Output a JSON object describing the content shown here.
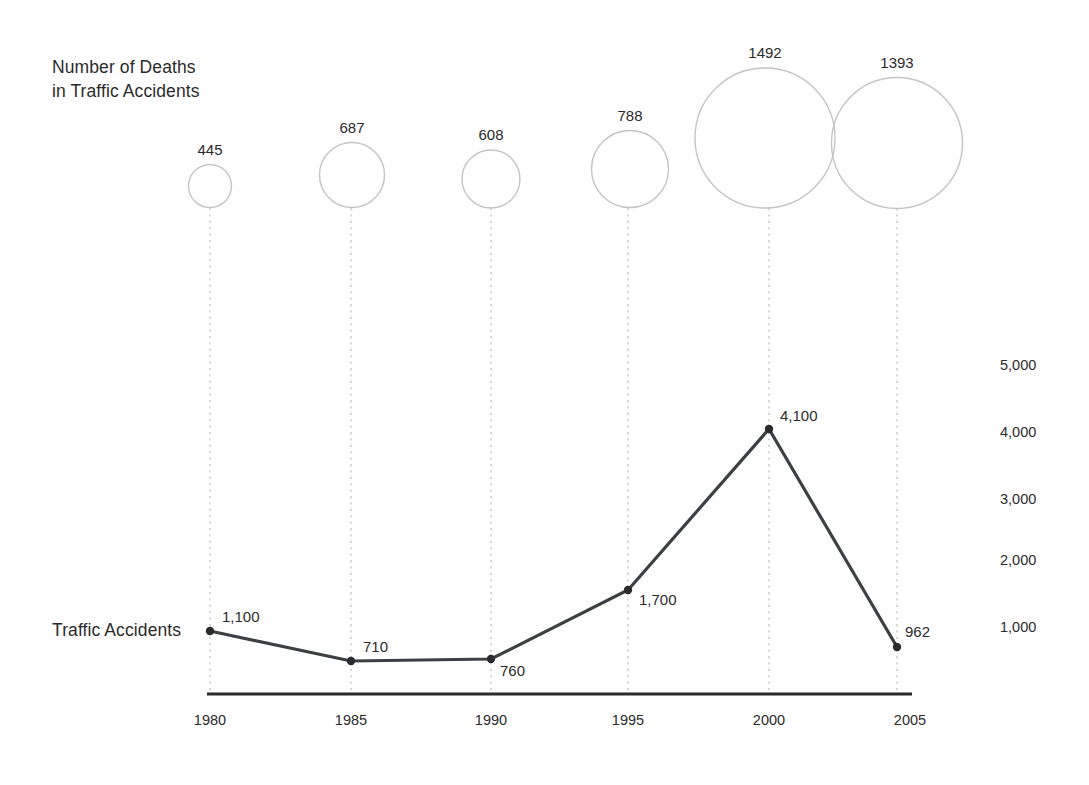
{
  "chart_data": {
    "type": "line",
    "title": "",
    "x": [
      1980,
      1985,
      1990,
      1995,
      2000,
      2005
    ],
    "xlabel": "",
    "ylabel": "",
    "grid": "vertical-dotted",
    "legend": "inline-series-labels",
    "series": [
      {
        "name": "Number of Deaths\nin Traffic Accidents",
        "render": "bubble",
        "values": [
          445,
          687,
          608,
          788,
          1492,
          1393
        ],
        "value_labels": [
          "445",
          "687",
          "608",
          "788",
          "1492",
          "1393"
        ]
      },
      {
        "name": "Traffic Accidents",
        "render": "line",
        "values": [
          1100,
          710,
          760,
          1700,
          4100,
          962
        ],
        "value_labels": [
          "1,100",
          "710",
          "760",
          "1,700",
          "4,100",
          "962"
        ],
        "ylim": [
          0,
          5000
        ],
        "yticks": [
          1000,
          2000,
          3000,
          4000,
          5000
        ],
        "ytick_labels": [
          "1,000",
          "2,000",
          "3,000",
          "4,000",
          "5,000"
        ]
      }
    ],
    "xtick_labels": [
      "1980",
      "1985",
      "1990",
      "1995",
      "2000",
      "2005"
    ]
  },
  "bubble_series": {
    "title": "Number of Deaths\nin Traffic Accidents",
    "points": [
      {
        "label": "445",
        "cx": 210,
        "cy": 186,
        "r": 21.5
      },
      {
        "label": "687",
        "cx": 352,
        "cy": 175,
        "r": 32.5
      },
      {
        "label": "608",
        "cx": 491,
        "cy": 179,
        "r": 29.0
      },
      {
        "label": "788",
        "cx": 630,
        "cy": 169,
        "r": 38.5
      },
      {
        "label": "1492",
        "cx": 765,
        "cy": 138,
        "r": 70.0
      },
      {
        "label": "1393",
        "cx": 897,
        "cy": 143,
        "r": 65.5
      }
    ]
  },
  "line_series": {
    "title": "Traffic Accidents",
    "points": [
      {
        "label": "1,100",
        "x": 210,
        "y": 631,
        "label_x": 222,
        "label_y": 608
      },
      {
        "label": "710",
        "x": 351,
        "y": 661,
        "label_x": 363,
        "label_y": 638
      },
      {
        "label": "760",
        "x": 491,
        "y": 659,
        "label_x": 500,
        "label_y": 662
      },
      {
        "label": "1,700",
        "x": 628,
        "y": 590,
        "label_x": 639,
        "label_y": 591
      },
      {
        "label": "4,100",
        "x": 769,
        "y": 429,
        "label_x": 780,
        "label_y": 407
      },
      {
        "label": "962",
        "x": 897,
        "y": 647,
        "label_x": 905,
        "label_y": 623
      }
    ]
  },
  "x_axis": {
    "ticks": [
      {
        "label": "1980",
        "x": 210
      },
      {
        "label": "1985",
        "x": 351
      },
      {
        "label": "1990",
        "x": 491
      },
      {
        "label": "1995",
        "x": 628
      },
      {
        "label": "2000",
        "x": 769
      },
      {
        "label": "2005",
        "x": 910
      }
    ],
    "line_y": 694,
    "line_x1": 207,
    "line_x2": 912,
    "label_y": 712
  },
  "y_axis": {
    "ticks": [
      {
        "label": "5,000",
        "y": 357
      },
      {
        "label": "4,000",
        "y": 424
      },
      {
        "label": "3,000",
        "y": 491
      },
      {
        "label": "2,000",
        "y": 552
      },
      {
        "label": "1,000",
        "y": 619
      }
    ],
    "label_x": 1000
  },
  "gridlines": {
    "x_positions": [
      210,
      351,
      491,
      628,
      769,
      897
    ],
    "y_top": 208,
    "y_bottom": 694,
    "color": "#b5b5b5"
  },
  "colors": {
    "bubble_stroke": "#c4c4c4",
    "line_stroke": "#3c4043",
    "point_fill": "#2b2b2b",
    "axis": "#2b2b2b",
    "text": "#2b2b2b",
    "background": "#ffffff"
  }
}
